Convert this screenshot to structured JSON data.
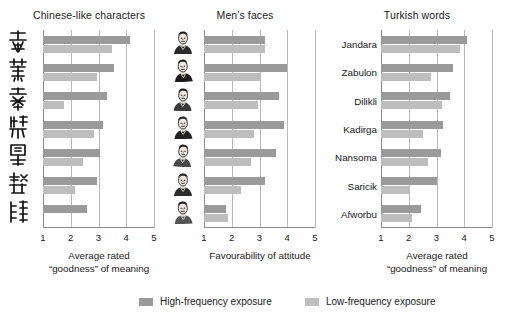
{
  "chart_data": [
    {
      "type": "bar",
      "title": "Chinese-like characters",
      "xlabel_line1": "Average rated",
      "xlabel_line2": "“goodness” of meaning",
      "ylabel": "",
      "orientation": "horizontal",
      "xlim": [
        1,
        5
      ],
      "ticks": [
        "1",
        "2",
        "3",
        "4",
        "5"
      ],
      "grid": true,
      "categories": [
        "char-1",
        "char-2",
        "char-3",
        "char-4",
        "char-5",
        "char-6",
        "char-7"
      ],
      "category_glyphs": [
        "氣",
        "蕙",
        "蒼",
        "絲",
        "閩",
        "髭",
        "巍"
      ],
      "series": [
        {
          "name": "High-frequency exposure",
          "color": "#9a9a9a",
          "values": [
            4.15,
            3.55,
            3.3,
            3.15,
            3.05,
            2.95,
            2.6
          ]
        },
        {
          "name": "Low-frequency exposure",
          "color": "#bdbdbd",
          "values": [
            3.5,
            2.95,
            1.75,
            2.85,
            2.45,
            2.15,
            1.0
          ]
        }
      ]
    },
    {
      "type": "bar",
      "title": "Men’s faces",
      "xlabel_line1": "Favourability of attitude",
      "xlabel_line2": "",
      "ylabel": "",
      "orientation": "horizontal",
      "xlim": [
        1,
        5
      ],
      "ticks": [
        "1",
        "2",
        "3",
        "4",
        "5"
      ],
      "grid": true,
      "categories": [
        "face-1",
        "face-2",
        "face-3",
        "face-4",
        "face-5",
        "face-6",
        "face-7"
      ],
      "series": [
        {
          "name": "High-frequency exposure",
          "color": "#9a9a9a",
          "values": [
            3.2,
            4.0,
            3.7,
            3.9,
            3.6,
            3.2,
            1.8
          ]
        },
        {
          "name": "Low-frequency exposure",
          "color": "#bdbdbd",
          "values": [
            3.2,
            3.0,
            2.95,
            2.8,
            2.7,
            2.35,
            1.85
          ]
        }
      ]
    },
    {
      "type": "bar",
      "title": "Turkish words",
      "xlabel_line1": "Average rated",
      "xlabel_line2": "“goodness” of meaning",
      "ylabel": "",
      "orientation": "horizontal",
      "xlim": [
        1,
        5
      ],
      "ticks": [
        "1",
        "2",
        "3",
        "4",
        "5"
      ],
      "grid": true,
      "categories": [
        "Jandara",
        "Zabulon",
        "Dilikli",
        "Kadirga",
        "Nansoma",
        "Saricik",
        "Afworbu"
      ],
      "series": [
        {
          "name": "High-frequency exposure",
          "color": "#9a9a9a",
          "values": [
            4.1,
            3.6,
            3.5,
            3.25,
            3.15,
            3.0,
            2.45
          ]
        },
        {
          "name": "Low-frequency exposure",
          "color": "#bdbdbd",
          "values": [
            3.85,
            2.8,
            3.2,
            2.5,
            2.7,
            2.0,
            2.1
          ]
        }
      ]
    }
  ],
  "legend": {
    "position": "bottom",
    "items": [
      {
        "label": "High-frequency exposure",
        "color": "#9a9a9a",
        "key": "high"
      },
      {
        "label": "Low-frequency exposure",
        "color": "#bdbdbd",
        "key": "low"
      }
    ]
  },
  "panel_titles": {
    "left": "Chinese-like characters",
    "middle": "Men’s faces",
    "right": "Turkish words"
  },
  "colors": {
    "high_frequency": "#9a9a9a",
    "low_frequency": "#bdbdbd",
    "gridline": "#b9b9b9",
    "axis": "#8a8a8a",
    "text": "#1a1a1a",
    "background": "#ffffff"
  }
}
